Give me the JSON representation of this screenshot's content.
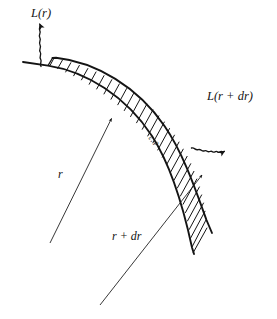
{
  "figure": {
    "type": "diagram",
    "background_color": "#ffffff",
    "ink_color": "#141414",
    "labels": {
      "luminosity_in": "L(r)",
      "luminosity_out": "L(r + dr)",
      "radius_inner": "r",
      "radius_outer": "r + dr",
      "shell_quantities": "ε, ρ"
    },
    "icons": {
      "wavy_arrow_left": "wavy-arrow-up-left-icon",
      "wavy_arrow_right": "wavy-arrow-up-right-icon",
      "radius_arrow_inner": "arrow-to-inner-boundary-icon",
      "radius_arrow_outer": "arrow-to-outer-boundary-icon",
      "hatching": "hatch-fill-icon"
    }
  }
}
